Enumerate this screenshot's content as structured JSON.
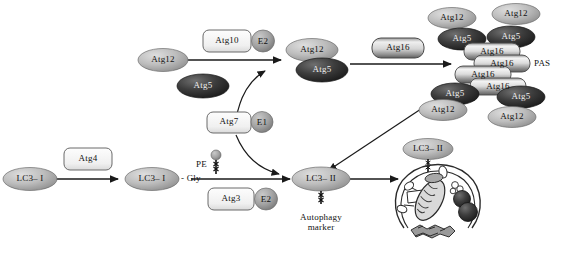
{
  "diagram": {
    "colors": {
      "light_oval": "#b9b9b9",
      "dark_oval": "#3a3a3a",
      "mid_oval": "#8f8f8f",
      "box_fill": "#f2f2f2",
      "box_stroke": "#6a6a6a",
      "cylinder_light": "#e8e8e8",
      "cylinder_dark": "#707070",
      "arrow": "#1a1a1a",
      "text": "#111111"
    },
    "nodes": {
      "atg12_start": "Atg12",
      "atg5_start": "Atg5",
      "atg10": "Atg10",
      "e2_top": "E2",
      "atg7": "Atg7",
      "e1": "E1",
      "atg12_conj": "Atg12",
      "atg5_conj": "Atg5",
      "atg16_free": "Atg16",
      "pas_label": "PAS",
      "lc3_1_start": "LC3– I",
      "atg4": "Atg4",
      "lc3_1_gly": "LC3– I",
      "gly": "- Gly",
      "pe": "PE",
      "atg3": "Atg3",
      "e2_bottom": "E2",
      "lc3_2": "LC3– II",
      "autophagy_marker_line1": "Autophagy",
      "autophagy_marker_line2": "marker",
      "lc3_2_membrane": "LC3– II"
    },
    "pas_complex": {
      "cylinders": [
        "Atg16",
        "Atg16",
        "Atg16",
        "Atg16"
      ],
      "upper_left_pair": {
        "top": "Atg12",
        "bottom": "Atg5"
      },
      "upper_right_pair": {
        "top": "Atg12",
        "bottom": "Atg5"
      },
      "lower_left_pair": {
        "top": "Atg5",
        "bottom": "Atg12"
      },
      "lower_right_pair": {
        "top": "Atg5",
        "bottom": "Atg12"
      }
    }
  }
}
